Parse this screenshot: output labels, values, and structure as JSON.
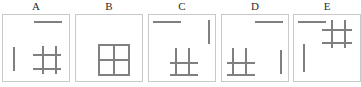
{
  "figure": {
    "type": "visual-reasoning-panels",
    "panel_count": 5,
    "stroke_color": "#808080",
    "border_color": "#c9c9c9",
    "background": "#ffffff",
    "stroke_width_px": 2,
    "panels": [
      {
        "label": "A",
        "box": {
          "x": 2,
          "y": 14,
          "w": 68,
          "h": 68
        },
        "elements": [
          {
            "name": "horizontal-bar",
            "kind": "h",
            "x": 34,
            "y": 21,
            "len": 28
          },
          {
            "name": "vertical-bar",
            "kind": "v",
            "x": 13,
            "y": 47,
            "len": 24
          },
          {
            "name": "lattice",
            "kind": "lattice",
            "x": 33,
            "y": 46,
            "w": 28,
            "h": 28,
            "h_lines": [
              8,
              22
            ],
            "v_lines": [
              9,
              22
            ]
          }
        ]
      },
      {
        "label": "B",
        "box": {
          "x": 75,
          "y": 14,
          "w": 68,
          "h": 68
        },
        "elements": [
          {
            "name": "closed-grid-box",
            "kind": "box-grid",
            "x": 98,
            "y": 44,
            "w": 32,
            "h": 32
          }
        ]
      },
      {
        "label": "C",
        "box": {
          "x": 148,
          "y": 14,
          "w": 68,
          "h": 68
        },
        "elements": [
          {
            "name": "horizontal-bar",
            "kind": "h",
            "x": 153,
            "y": 21,
            "len": 28
          },
          {
            "name": "vertical-bar",
            "kind": "v",
            "x": 208,
            "y": 20,
            "len": 24
          },
          {
            "name": "lattice",
            "kind": "lattice",
            "x": 170,
            "y": 48,
            "w": 28,
            "h": 28,
            "h_lines": [
              14,
              26
            ],
            "v_lines": [
              5,
              18
            ]
          }
        ]
      },
      {
        "label": "D",
        "box": {
          "x": 221,
          "y": 14,
          "w": 68,
          "h": 68
        },
        "elements": [
          {
            "name": "horizontal-bar",
            "kind": "h",
            "x": 255,
            "y": 21,
            "len": 28
          },
          {
            "name": "vertical-bar",
            "kind": "v",
            "x": 280,
            "y": 50,
            "len": 24
          },
          {
            "name": "lattice",
            "kind": "lattice",
            "x": 227,
            "y": 48,
            "w": 28,
            "h": 28,
            "h_lines": [
              14,
              26
            ],
            "v_lines": [
              5,
              18
            ]
          }
        ]
      },
      {
        "label": "E",
        "box": {
          "x": 293,
          "y": 14,
          "w": 68,
          "h": 68
        },
        "elements": [
          {
            "name": "horizontal-bar",
            "kind": "h",
            "x": 298,
            "y": 21,
            "len": 28
          },
          {
            "name": "vertical-bar",
            "kind": "v",
            "x": 303,
            "y": 44,
            "len": 28
          },
          {
            "name": "lattice",
            "kind": "lattice",
            "x": 322,
            "y": 20,
            "w": 30,
            "h": 28,
            "h_lines": [
              9,
              22
            ],
            "v_lines": [
              9,
              22
            ]
          }
        ]
      }
    ],
    "labels": [
      {
        "text": "A",
        "x": 2,
        "y": 0,
        "w": 68
      },
      {
        "text": "B",
        "x": 75,
        "y": 0,
        "w": 68
      },
      {
        "text": "C",
        "x": 148,
        "y": 0,
        "w": 68
      },
      {
        "text": "D",
        "x": 221,
        "y": 0,
        "w": 68
      },
      {
        "text": "E",
        "x": 293,
        "y": 0,
        "w": 68
      }
    ]
  }
}
